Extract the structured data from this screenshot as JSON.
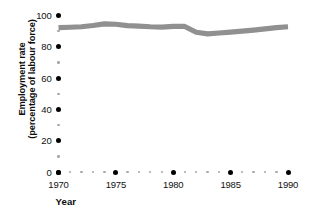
{
  "chart_data": {
    "type": "line",
    "title": "",
    "xlabel": "Year",
    "ylabel_line1": "Employment rate",
    "ylabel_line2": "(percentage of labour force)",
    "series_name": "Employment rate",
    "series_color": "#909090",
    "grid": false,
    "legend": "none",
    "xlim": [
      1970,
      1990
    ],
    "ylim": [
      0,
      100
    ],
    "x_major_ticks": [
      "1970",
      "1975",
      "1980",
      "1985",
      "1990"
    ],
    "x_major_values": [
      1970,
      1975,
      1980,
      1985,
      1990
    ],
    "x_minor_values": [
      1971,
      1972,
      1973,
      1974,
      1976,
      1977,
      1978,
      1979,
      1981,
      1982,
      1983,
      1984,
      1986,
      1987,
      1988,
      1989
    ],
    "y_major_ticks": [
      "100",
      "80",
      "60",
      "40",
      "20",
      "0"
    ],
    "y_major_values": [
      100,
      80,
      60,
      40,
      20,
      0
    ],
    "y_minor_values": [
      90,
      70,
      50,
      30,
      10
    ],
    "x": [
      1970,
      1971,
      1972,
      1973,
      1974,
      1975,
      1976,
      1977,
      1978,
      1979,
      1980,
      1981,
      1982,
      1983,
      1984,
      1985,
      1986,
      1987,
      1988,
      1989,
      1990
    ],
    "values": [
      92.3,
      92.5,
      92.8,
      93.6,
      94.6,
      94.4,
      93.5,
      93.2,
      92.8,
      92.6,
      93.1,
      93.0,
      89.3,
      88.3,
      88.8,
      89.4,
      90.0,
      90.7,
      91.5,
      92.3,
      92.8
    ]
  },
  "axis_colors": {
    "major_dot": "#000000",
    "minor_dot": "#a8a8a8",
    "line": "#909090",
    "text": "#111111",
    "background": "#ffffff"
  }
}
